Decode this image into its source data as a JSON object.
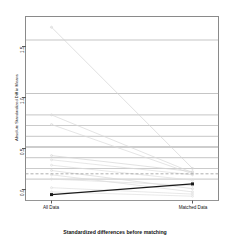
{
  "chart_data": {
    "type": "line",
    "title": "",
    "caption": "Standardized differences before matching",
    "xlabel": "",
    "ylabel": "Absolute Standardized Diff in Means",
    "categories": [
      "All Data",
      "Matched Data"
    ],
    "x": [
      0,
      1
    ],
    "xlim": [
      -0.08,
      1.08
    ],
    "ylim": [
      0.0,
      1.72
    ],
    "yticks": [
      0.0,
      0.5,
      1.0,
      1.5
    ],
    "ytick_labels": [
      "0.0",
      "0.5",
      "1.0",
      "1.5"
    ],
    "gridlines": [
      0.2,
      0.3,
      0.4,
      0.5,
      0.6,
      0.7,
      0.8
    ],
    "grid": true,
    "legend": "none",
    "reference_line": {
      "value": 0.25,
      "style": "dashed",
      "color": "#9a9a9a"
    },
    "highlight_series": {
      "name": "Distance / Propensity Score",
      "values": [
        0.055,
        0.155
      ],
      "color": "#1a1a1a",
      "marker": "filled-square",
      "emphasis": true
    },
    "series": [
      {
        "name": "covariate-1",
        "values": [
          1.62,
          0.3
        ],
        "color": "#d2d2d2"
      },
      {
        "name": "covariate-2",
        "values": [
          0.8,
          0.26
        ],
        "color": "#d8d8d8"
      },
      {
        "name": "covariate-3",
        "values": [
          0.71,
          0.25
        ],
        "color": "#dadada"
      },
      {
        "name": "covariate-4",
        "values": [
          0.42,
          0.27
        ],
        "color": "#d6d6d6"
      },
      {
        "name": "covariate-5",
        "values": [
          0.38,
          0.24
        ],
        "color": "#dcdcdc"
      },
      {
        "name": "covariate-6",
        "values": [
          0.33,
          0.19
        ],
        "color": "#dedede"
      },
      {
        "name": "covariate-7",
        "values": [
          0.28,
          0.11
        ],
        "color": "#d9d9d9"
      },
      {
        "name": "covariate-8",
        "values": [
          0.24,
          0.08
        ],
        "color": "#dbdbdb"
      },
      {
        "name": "covariate-9",
        "values": [
          0.2,
          0.14
        ],
        "color": "#dddddd"
      },
      {
        "name": "covariate-10",
        "values": [
          0.12,
          0.06
        ],
        "color": "#dedede"
      },
      {
        "name": "covariate-11",
        "values": [
          0.08,
          0.04
        ],
        "color": "#e0e0e0"
      }
    ],
    "colors": {
      "axis": "#5a5a5a",
      "grid": "#9e9e9e",
      "box": "#8a8a8a",
      "faint": "#dcdcdc",
      "highlight": "#1a1a1a",
      "background": "#ffffff"
    }
  }
}
